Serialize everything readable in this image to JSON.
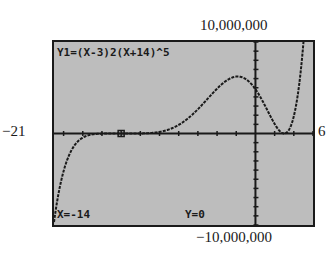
{
  "chart_data": {
    "type": "line",
    "title": "Y1=(X-3)2(X+14)^5",
    "function": "(x-3)^2*(x+14)^5",
    "xlim": [
      -21,
      6
    ],
    "ylim": [
      -10000000,
      10000000
    ],
    "window_labels": {
      "xmin": "−21",
      "xmax": "6",
      "ymin": "−10,000,000",
      "ymax": "10,000,000"
    },
    "trace": {
      "x_label": "X=-14",
      "y_label": "Y=0",
      "x": -14,
      "y": 0
    },
    "key_points": [
      {
        "x": -14,
        "y": 0,
        "note": "zero (trace cursor)"
      },
      {
        "x": 3,
        "y": 0,
        "note": "double zero"
      },
      {
        "x": -2.29,
        "y": 6069000,
        "note": "local max (approx)"
      }
    ],
    "grid": false,
    "axes": true,
    "colors": {
      "screen": "#bdbdbd",
      "ink": "#1a1a1a"
    }
  }
}
